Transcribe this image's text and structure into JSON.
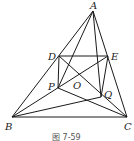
{
  "figure": {
    "caption": "图 7-59",
    "points": {
      "A": {
        "label": "A",
        "x": 93,
        "y": 11
      },
      "B": {
        "label": "B",
        "x": 12,
        "y": 117
      },
      "C": {
        "label": "C",
        "x": 127,
        "y": 117
      },
      "D": {
        "label": "D",
        "x": 59,
        "y": 56
      },
      "E": {
        "label": "E",
        "x": 108,
        "y": 56
      },
      "P": {
        "label": "P",
        "x": 58,
        "y": 88
      },
      "Q": {
        "label": "Q",
        "x": 101,
        "y": 97
      },
      "O": {
        "label": "O"
      }
    },
    "segments": [
      "AB",
      "AC",
      "BC",
      "DE",
      "DP",
      "EQ",
      "AP",
      "AQ",
      "BE",
      "CD",
      "BQ",
      "CP"
    ]
  }
}
